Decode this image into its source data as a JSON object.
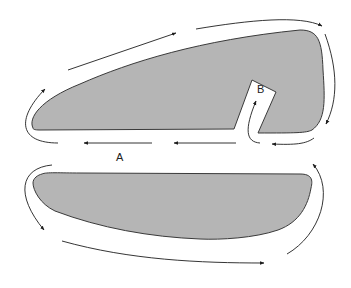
{
  "diagram": {
    "labels": {
      "a": "A",
      "b": "B"
    },
    "colors": {
      "shape_fill": "#b5b5b5",
      "shape_stroke": "#3a3a3a",
      "arrow": "#1e1e1e",
      "background": "#ffffff"
    }
  }
}
